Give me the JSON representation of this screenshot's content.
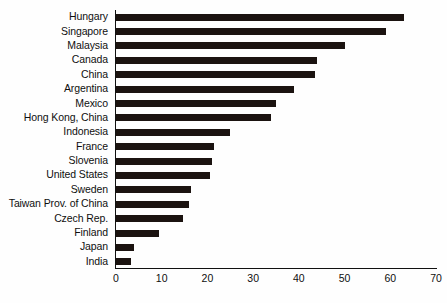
{
  "chart_data": {
    "type": "bar",
    "orientation": "horizontal",
    "title": "",
    "subtitle": "",
    "xlabel": "",
    "ylabel": "",
    "xlim": [
      0,
      70
    ],
    "ylim": null,
    "grid": false,
    "legend": null,
    "bar_color": "#1b1310",
    "axis_color": "#111111",
    "background_color": "#fefefe",
    "xticks": [
      0,
      10,
      20,
      30,
      40,
      50,
      60,
      70
    ],
    "xtick_labels": [
      "0",
      "10",
      "20",
      "30",
      "40",
      "50",
      "60",
      "70"
    ],
    "categories": [
      "Hungary",
      "Singapore",
      "Malaysia",
      "Canada",
      "China",
      "Argentina",
      "Mexico",
      "Hong Kong, China",
      "Indonesia",
      "France",
      "Slovenia",
      "United States",
      "Sweden",
      "Taiwan Prov. of China",
      "Czech Rep.",
      "Finland",
      "Japan",
      "India"
    ],
    "values": [
      63,
      59,
      50,
      44,
      43.5,
      39,
      35,
      34,
      25,
      21.5,
      21,
      20.5,
      16.5,
      16,
      14.6,
      9.5,
      4,
      3.3
    ]
  }
}
